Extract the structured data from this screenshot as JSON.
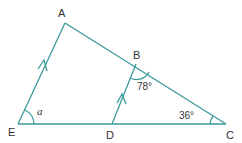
{
  "diagram": {
    "type": "geometry-triangle",
    "colors": {
      "line": "#3a9a9a",
      "text": "#333333",
      "background": "#ffffff"
    },
    "points": {
      "A": {
        "label": "A",
        "x": 65,
        "y": 23
      },
      "B": {
        "label": "B",
        "x": 136,
        "y": 64
      },
      "C": {
        "label": "C",
        "x": 226,
        "y": 124
      },
      "D": {
        "label": "D",
        "x": 112,
        "y": 124
      },
      "E": {
        "label": "E",
        "x": 18,
        "y": 124
      }
    },
    "angles": {
      "B": "78°",
      "C": "36°",
      "E": "a"
    },
    "parallel_marks": [
      "AE",
      "BD"
    ]
  }
}
